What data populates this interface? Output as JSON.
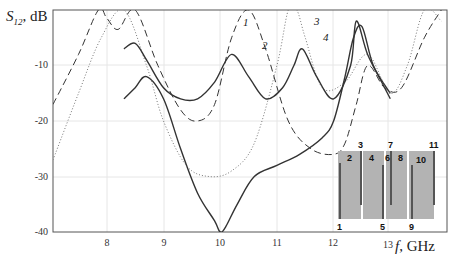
{
  "chart_data": {
    "type": "line",
    "title": "",
    "xlabel": "f, GHz",
    "ylabel": "S12, dB",
    "ylabel_main": "S",
    "ylabel_sub": "12",
    "ylabel_unit": ", dB",
    "xlabel_var": "f",
    "xlabel_unit": ", GHz",
    "xlim": [
      7.05,
      14.0
    ],
    "ylim": [
      -40,
      0
    ],
    "grid": true,
    "x_ticks": [
      "8",
      "9",
      "10",
      "11",
      "12",
      "13"
    ],
    "y_ticks": [
      "-10",
      "-20",
      "-30",
      "-40"
    ],
    "curve_labels": [
      "1",
      "2",
      "3",
      "4"
    ],
    "series": [
      {
        "name": "1",
        "style": "dashed",
        "x": [
          7.05,
          7.5,
          7.85,
          8.0,
          8.2,
          8.5,
          8.9,
          9.3,
          9.6,
          9.9,
          10.2,
          10.5,
          10.8,
          11.2,
          11.6,
          12.0,
          12.2,
          12.4,
          12.6,
          12.9,
          13.2,
          13.6,
          13.9
        ],
        "y": [
          -17,
          -8,
          0,
          -1.5,
          -3.5,
          0,
          -10,
          -18,
          -20,
          -17,
          -5,
          0,
          -7,
          -20,
          -25,
          -26,
          -24,
          -17,
          -10,
          -14,
          -14,
          -5,
          0
        ]
      },
      {
        "name": "2",
        "style": "solid",
        "x": [
          8.3,
          8.5,
          8.7,
          9.0,
          9.3,
          9.6,
          9.9,
          10.0,
          10.1,
          10.3,
          10.6,
          11.0,
          11.4,
          11.8,
          12.0,
          12.2,
          12.35,
          12.5,
          12.7,
          13.0
        ],
        "y": [
          -16,
          -14,
          -12,
          -16,
          -25,
          -33,
          -38,
          -40,
          -39,
          -35,
          -30,
          -28,
          -26,
          -23,
          -20,
          -12,
          -5,
          -3,
          -10,
          -15
        ]
      },
      {
        "name": "3",
        "style": "dotted",
        "x": [
          7.05,
          7.5,
          7.9,
          8.3,
          8.7,
          9.0,
          9.4,
          9.8,
          10.2,
          10.6,
          11.0,
          11.2,
          11.35,
          11.5,
          11.8,
          12.2,
          12.6,
          13.0,
          13.3,
          13.6,
          13.9
        ],
        "y": [
          -27,
          -15,
          -5,
          0,
          -10,
          -20,
          -28,
          -30,
          -29,
          -24,
          -10,
          0,
          0,
          -5,
          -14,
          -13,
          -8,
          -15,
          -10,
          0,
          -2
        ]
      },
      {
        "name": "4",
        "style": "solid",
        "x": [
          8.3,
          8.5,
          8.7,
          9.0,
          9.3,
          9.6,
          9.9,
          10.2,
          10.5,
          10.8,
          11.1,
          11.3,
          11.45,
          11.7,
          12.0,
          12.3,
          12.4,
          12.6,
          12.9,
          13.0
        ],
        "y": [
          -7,
          -6,
          -9,
          -14,
          -16,
          -16,
          -13,
          -8,
          -12,
          -16,
          -14,
          -10,
          -7,
          -12,
          -16,
          -10,
          -2,
          -8,
          -14,
          -16
        ]
      }
    ],
    "inset": {
      "description": "stepped-impedance structure with numbered sections",
      "top_labels": [
        "3",
        "7",
        "11"
      ],
      "bottom_labels": [
        "1",
        "5",
        "9"
      ],
      "block_labels": [
        "2",
        "4",
        "6",
        "8",
        "10"
      ]
    }
  }
}
